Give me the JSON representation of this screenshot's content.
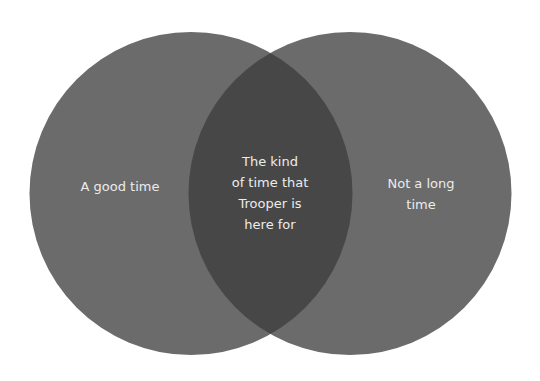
{
  "diagram": {
    "type": "venn",
    "colors": {
      "background": "#ffffff",
      "circle": "#6b6b6b",
      "overlap": "#474747",
      "text": "#ececec"
    },
    "sets": [
      {
        "label": "A good time",
        "lines": [
          "A good time"
        ]
      },
      {
        "label": "Not a long time",
        "lines": [
          "Not a long",
          "time"
        ]
      }
    ],
    "intersection": {
      "label": "The kind of time that Trooper is here for",
      "lines": [
        "The kind",
        "of time that",
        "Trooper is",
        "here for"
      ]
    }
  }
}
